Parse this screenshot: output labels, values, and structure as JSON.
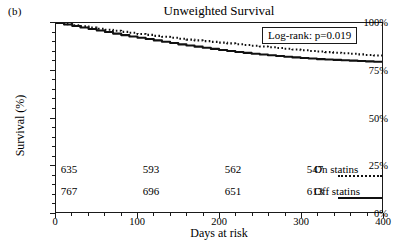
{
  "panel": {
    "label": "(b)"
  },
  "axes": {
    "y_title": "Survival (%)",
    "x_title": "Days at risk",
    "y_ticks": [
      "0%",
      "25%",
      "50%",
      "75%",
      "100%"
    ],
    "x_ticks": [
      "0",
      "100",
      "200",
      "300",
      "400"
    ]
  },
  "annotation": {
    "text": "Log-rank: p=0.019"
  },
  "risk_table": {
    "on": {
      "label": "On statins",
      "key": "dotted-line",
      "counts": [
        "635",
        "593",
        "562",
        "547"
      ]
    },
    "off": {
      "label": "Off statins",
      "key": "solid-line",
      "counts": [
        "767",
        "696",
        "651",
        "613"
      ]
    },
    "count_days": [
      0,
      100,
      200,
      300
    ]
  },
  "chart_data": {
    "type": "line",
    "title": "Unweighted Survival",
    "xlabel": "Days at risk",
    "ylabel": "Survival (%)",
    "xlim": [
      0,
      400
    ],
    "ylim": [
      0,
      100
    ],
    "xticks": [
      0,
      100,
      200,
      300,
      400
    ],
    "yticks": [
      0,
      25,
      50,
      75,
      100
    ],
    "grid": false,
    "legend_position": "bottom-right",
    "annotations": [
      "Log-rank: p=0.019"
    ],
    "series": [
      {
        "name": "On statins",
        "style": "dotted",
        "color": "#111111",
        "n_at_risk": [
          635,
          593,
          562,
          547
        ],
        "x": [
          0,
          10,
          20,
          30,
          40,
          50,
          60,
          70,
          80,
          90,
          100,
          110,
          120,
          130,
          140,
          150,
          160,
          170,
          180,
          190,
          200,
          210,
          220,
          230,
          240,
          250,
          260,
          270,
          280,
          290,
          300,
          310,
          320,
          330,
          340,
          350,
          360,
          370,
          380,
          390,
          400
        ],
        "values": [
          100.0,
          99.4,
          98.8,
          98.2,
          97.6,
          97.0,
          96.4,
          95.9,
          95.3,
          94.8,
          94.2,
          93.7,
          93.2,
          92.7,
          92.2,
          91.7,
          91.2,
          90.8,
          90.4,
          90.0,
          89.6,
          89.2,
          88.8,
          88.4,
          88.0,
          87.6,
          87.2,
          86.8,
          86.4,
          86.0,
          85.6,
          85.2,
          84.9,
          84.6,
          84.3,
          84.0,
          83.7,
          83.4,
          83.1,
          82.8,
          82.5
        ]
      },
      {
        "name": "Off statins",
        "style": "solid",
        "color": "#111111",
        "n_at_risk": [
          767,
          696,
          651,
          613
        ],
        "x": [
          0,
          10,
          20,
          30,
          40,
          50,
          60,
          70,
          80,
          90,
          100,
          110,
          120,
          130,
          140,
          150,
          160,
          170,
          180,
          190,
          200,
          210,
          220,
          230,
          240,
          250,
          260,
          270,
          280,
          290,
          300,
          310,
          320,
          330,
          340,
          350,
          360,
          370,
          380,
          390,
          400
        ],
        "values": [
          100.0,
          99.2,
          98.4,
          97.6,
          96.8,
          96.0,
          95.2,
          94.4,
          93.6,
          92.9,
          92.2,
          91.5,
          90.8,
          90.1,
          89.4,
          88.7,
          88.1,
          87.5,
          86.9,
          86.3,
          85.7,
          85.2,
          84.7,
          84.2,
          83.7,
          83.3,
          82.9,
          82.5,
          82.1,
          81.8,
          81.5,
          81.2,
          80.9,
          80.7,
          80.5,
          80.3,
          80.1,
          79.9,
          79.7,
          79.5,
          79.3
        ]
      }
    ]
  }
}
